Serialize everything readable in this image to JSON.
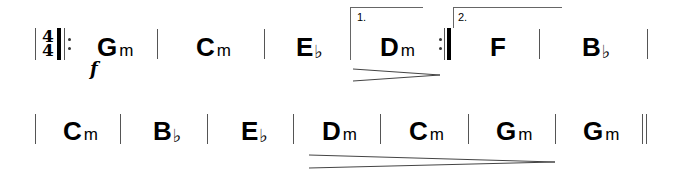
{
  "score": {
    "time_signature": {
      "numerator": "4",
      "denominator": "4"
    },
    "dynamic": "f",
    "system1": {
      "measures": [
        {
          "root": "G",
          "quality": "m",
          "accidental": ""
        },
        {
          "root": "C",
          "quality": "m",
          "accidental": ""
        },
        {
          "root": "E",
          "quality": "",
          "accidental": "♭"
        },
        {
          "root": "D",
          "quality": "m",
          "accidental": ""
        },
        {
          "root": "F",
          "quality": "",
          "accidental": ""
        },
        {
          "root": "B",
          "quality": "",
          "accidental": "♭"
        }
      ],
      "volta1_label": "1.",
      "volta2_label": "2."
    },
    "system2": {
      "measures": [
        {
          "root": "C",
          "quality": "m",
          "accidental": ""
        },
        {
          "root": "B",
          "quality": "",
          "accidental": "♭"
        },
        {
          "root": "E",
          "quality": "",
          "accidental": "♭"
        },
        {
          "root": "D",
          "quality": "m",
          "accidental": ""
        },
        {
          "root": "C",
          "quality": "m",
          "accidental": ""
        },
        {
          "root": "G",
          "quality": "m",
          "accidental": ""
        },
        {
          "root": "G",
          "quality": "m",
          "accidental": ""
        }
      ]
    }
  }
}
